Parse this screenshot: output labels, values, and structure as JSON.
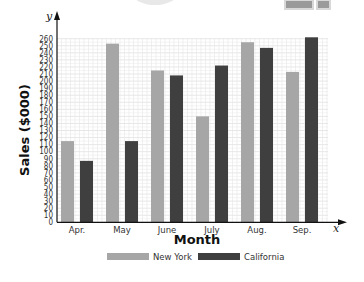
{
  "chart_data": {
    "type": "bar",
    "title": "",
    "xlabel": "Month",
    "ylabel": "Sales ($000)",
    "x_axis_var": "x",
    "y_axis_var": "y",
    "categories": [
      "Apr.",
      "May",
      "June",
      "July",
      "Aug.",
      "Sep."
    ],
    "series": [
      {
        "name": "New York",
        "color": "#a6a6a6",
        "values": [
          115,
          253,
          215,
          150,
          255,
          213
        ]
      },
      {
        "name": "California",
        "color": "#3f3f3f",
        "values": [
          87,
          115,
          208,
          222,
          247,
          262
        ]
      }
    ],
    "ylim": [
      0,
      260
    ],
    "yticks": [
      0,
      10,
      20,
      30,
      40,
      50,
      60,
      70,
      80,
      90,
      100,
      110,
      120,
      130,
      140,
      150,
      160,
      170,
      180,
      190,
      200,
      210,
      220,
      230,
      240,
      250,
      260
    ],
    "grid": true,
    "legend_position": "bottom"
  },
  "legend": {
    "items": [
      {
        "label": "New York",
        "color": "#a6a6a6"
      },
      {
        "label": "California",
        "color": "#3f3f3f"
      }
    ]
  }
}
